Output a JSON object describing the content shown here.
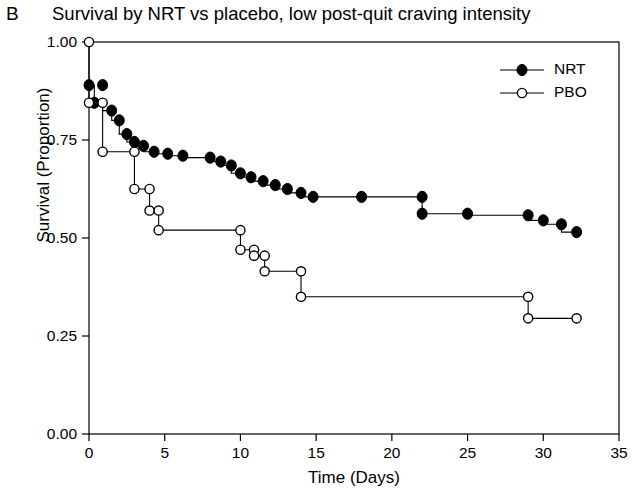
{
  "panel": {
    "label": "B"
  },
  "chart_data": {
    "type": "line",
    "subtype": "kaplan-meier-survival",
    "title": "Survival by NRT vs placebo, low post-quit craving intensity",
    "xlabel": "Time (Days)",
    "ylabel": "Survival (Proportion)",
    "xlim": [
      0,
      35
    ],
    "ylim": [
      0.0,
      1.0
    ],
    "xticks": [
      0,
      5,
      10,
      15,
      20,
      25,
      30,
      35
    ],
    "xtick_labels": [
      "0",
      "5",
      "10",
      "15",
      "20",
      "25",
      "30",
      "35"
    ],
    "yticks": [
      0.0,
      0.25,
      0.5,
      0.75,
      1.0
    ],
    "ytick_labels": [
      "0.00",
      "0.25",
      "0.50",
      "0.75",
      "1.00"
    ],
    "grid": false,
    "legend_position": "top-right",
    "series": [
      {
        "name": "NRT",
        "marker": "filled-circle",
        "color": "#000000",
        "points": [
          [
            0.0,
            0.89
          ],
          [
            0.35,
            0.89
          ],
          [
            0.35,
            0.845
          ],
          [
            0.9,
            0.845
          ],
          [
            0.9,
            0.825
          ],
          [
            1.5,
            0.825
          ],
          [
            1.5,
            0.8
          ],
          [
            2.0,
            0.8
          ],
          [
            2.0,
            0.765
          ],
          [
            2.5,
            0.765
          ],
          [
            2.5,
            0.745
          ],
          [
            3.0,
            0.745
          ],
          [
            3.0,
            0.735
          ],
          [
            3.6,
            0.735
          ],
          [
            3.6,
            0.72
          ],
          [
            4.3,
            0.72
          ],
          [
            4.3,
            0.715
          ],
          [
            5.2,
            0.715
          ],
          [
            5.2,
            0.71
          ],
          [
            6.2,
            0.71
          ],
          [
            6.2,
            0.705
          ],
          [
            8.0,
            0.705
          ],
          [
            8.0,
            0.695
          ],
          [
            8.7,
            0.695
          ],
          [
            8.7,
            0.685
          ],
          [
            9.4,
            0.685
          ],
          [
            9.4,
            0.665
          ],
          [
            10.0,
            0.665
          ],
          [
            10.0,
            0.655
          ],
          [
            10.7,
            0.655
          ],
          [
            10.7,
            0.645
          ],
          [
            11.5,
            0.645
          ],
          [
            11.5,
            0.635
          ],
          [
            12.3,
            0.635
          ],
          [
            12.3,
            0.625
          ],
          [
            13.1,
            0.625
          ],
          [
            13.1,
            0.615
          ],
          [
            14.0,
            0.615
          ],
          [
            14.0,
            0.605
          ],
          [
            14.8,
            0.605
          ],
          [
            18.0,
            0.605
          ],
          [
            22.0,
            0.605
          ],
          [
            22.0,
            0.562
          ],
          [
            25.0,
            0.562
          ],
          [
            25.0,
            0.558
          ],
          [
            29.0,
            0.558
          ],
          [
            29.0,
            0.545
          ],
          [
            30.0,
            0.545
          ],
          [
            30.0,
            0.535
          ],
          [
            31.2,
            0.535
          ],
          [
            31.2,
            0.515
          ],
          [
            32.2,
            0.515
          ]
        ],
        "markers": [
          [
            0.0,
            0.89
          ],
          [
            0.9,
            0.89
          ],
          [
            0.35,
            0.845
          ],
          [
            1.5,
            0.825
          ],
          [
            2.0,
            0.8
          ],
          [
            2.5,
            0.765
          ],
          [
            3.0,
            0.745
          ],
          [
            3.6,
            0.735
          ],
          [
            4.3,
            0.72
          ],
          [
            5.2,
            0.715
          ],
          [
            6.2,
            0.71
          ],
          [
            8.0,
            0.705
          ],
          [
            8.7,
            0.695
          ],
          [
            9.4,
            0.685
          ],
          [
            10.0,
            0.665
          ],
          [
            10.7,
            0.655
          ],
          [
            11.5,
            0.645
          ],
          [
            12.3,
            0.635
          ],
          [
            13.1,
            0.625
          ],
          [
            14.0,
            0.615
          ],
          [
            14.8,
            0.605
          ],
          [
            18.0,
            0.605
          ],
          [
            22.0,
            0.605
          ],
          [
            22.0,
            0.562
          ],
          [
            25.0,
            0.562
          ],
          [
            29.0,
            0.558
          ],
          [
            30.0,
            0.545
          ],
          [
            31.2,
            0.535
          ],
          [
            32.2,
            0.515
          ]
        ]
      },
      {
        "name": "PBO",
        "marker": "open-circle",
        "color": "#000000",
        "points": [
          [
            0.0,
            1.0
          ],
          [
            0.0,
            0.845
          ],
          [
            0.9,
            0.845
          ],
          [
            0.9,
            0.72
          ],
          [
            3.0,
            0.72
          ],
          [
            3.0,
            0.625
          ],
          [
            4.0,
            0.625
          ],
          [
            4.0,
            0.57
          ],
          [
            4.6,
            0.57
          ],
          [
            4.6,
            0.52
          ],
          [
            5.3,
            0.52
          ],
          [
            9.0,
            0.52
          ],
          [
            10.0,
            0.52
          ],
          [
            10.0,
            0.47
          ],
          [
            10.9,
            0.47
          ],
          [
            10.9,
            0.455
          ],
          [
            11.6,
            0.455
          ],
          [
            11.6,
            0.415
          ],
          [
            14.0,
            0.415
          ],
          [
            14.0,
            0.35
          ],
          [
            14.8,
            0.35
          ],
          [
            29.0,
            0.35
          ],
          [
            29.0,
            0.295
          ],
          [
            32.2,
            0.295
          ]
        ],
        "markers": [
          [
            0.0,
            1.0
          ],
          [
            0.0,
            0.845
          ],
          [
            0.9,
            0.845
          ],
          [
            0.9,
            0.72
          ],
          [
            3.0,
            0.72
          ],
          [
            3.0,
            0.625
          ],
          [
            4.0,
            0.625
          ],
          [
            4.0,
            0.57
          ],
          [
            4.6,
            0.57
          ],
          [
            4.6,
            0.52
          ],
          [
            10.0,
            0.52
          ],
          [
            10.0,
            0.47
          ],
          [
            10.9,
            0.47
          ],
          [
            10.9,
            0.455
          ],
          [
            11.6,
            0.455
          ],
          [
            11.6,
            0.415
          ],
          [
            14.0,
            0.415
          ],
          [
            14.0,
            0.35
          ],
          [
            29.0,
            0.35
          ],
          [
            29.0,
            0.295
          ],
          [
            32.2,
            0.295
          ]
        ]
      }
    ],
    "legend": [
      {
        "label": "NRT",
        "marker": "filled-circle"
      },
      {
        "label": "PBO",
        "marker": "open-circle"
      }
    ]
  }
}
